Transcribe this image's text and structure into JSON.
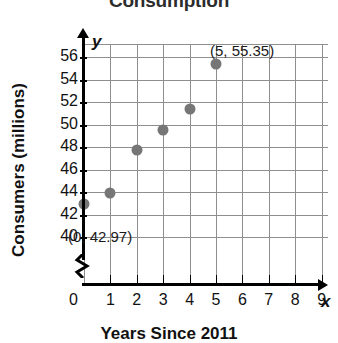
{
  "chart_data": {
    "type": "scatter",
    "title": "Consumption",
    "xlabel": "Years Since 2011",
    "ylabel": "Consumers (millions)",
    "x": [
      0,
      1,
      2,
      3,
      4,
      5
    ],
    "values": [
      42.97,
      43.9,
      47.7,
      49.5,
      51.4,
      55.35
    ],
    "xlim": [
      0,
      9
    ],
    "ylim": [
      40,
      57
    ],
    "y_axis_break": true,
    "y_zero_shown": true,
    "grid": true,
    "legend": "none",
    "point_color": "#767676",
    "xticks": [
      "0",
      "1",
      "2",
      "3",
      "4",
      "5",
      "6",
      "7",
      "8",
      "9"
    ],
    "yticks": [
      "40",
      "42",
      "44",
      "46",
      "48",
      "50",
      "52",
      "54",
      "56"
    ],
    "x_axis_variable": "x",
    "y_axis_variable": "y",
    "annotations": [
      {
        "text": "(0, 42.97)",
        "x": 0,
        "y": 42.97
      },
      {
        "text": "(5, 55.35)",
        "x": 5,
        "y": 55.35
      }
    ]
  }
}
